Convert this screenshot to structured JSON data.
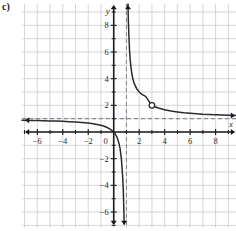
{
  "figure": {
    "part_label": "c)",
    "axis_names": {
      "x": "x",
      "y": "y"
    }
  },
  "chart_data": {
    "type": "line",
    "title": "",
    "xlabel": "x",
    "ylabel": "y",
    "grid": true,
    "legend": "none",
    "xlim": [
      -7.2,
      9.6
    ],
    "ylim": [
      -7.2,
      9.6
    ],
    "xticks": [
      -6,
      -4,
      -2,
      0,
      2,
      4,
      6,
      8
    ],
    "yticks": [
      -6,
      -4,
      -2,
      2,
      4,
      6,
      8
    ],
    "xtick_labels": [
      "−6",
      "−4",
      "−2",
      "0",
      "2",
      "4",
      "6",
      "8"
    ],
    "ytick_labels": [
      "−6",
      "−4",
      "−2",
      "2",
      "4",
      "6",
      "8"
    ],
    "origin_label": "0",
    "tick_step": 1,
    "asymptotes": [
      {
        "kind": "vertical",
        "value": 1,
        "style": "dashed",
        "label": "x = 1"
      },
      {
        "kind": "horizontal",
        "value": 1,
        "style": "dashed",
        "label": "y = 1"
      }
    ],
    "holes": [
      {
        "x": 3,
        "y": 2,
        "style": "open-circle"
      }
    ],
    "series": [
      {
        "name": "left-branch",
        "description": "branch left of x = 1, approaches y = 1 from below going left and dives to minus infinity approaching x = 1",
        "arrows": [
          "left",
          "down"
        ],
        "points": [
          [
            -7.2,
            0.878
          ],
          [
            -6.5,
            0.867
          ],
          [
            -6.0,
            0.857
          ],
          [
            -5.5,
            0.846
          ],
          [
            -5.0,
            0.833
          ],
          [
            -4.5,
            0.818
          ],
          [
            -4.0,
            0.8
          ],
          [
            -3.5,
            0.778
          ],
          [
            -3.0,
            0.75
          ],
          [
            -2.5,
            0.714
          ],
          [
            -2.0,
            0.667
          ],
          [
            -1.5,
            0.6
          ],
          [
            -1.0,
            0.5
          ],
          [
            -0.75,
            0.429
          ],
          [
            -0.5,
            0.333
          ],
          [
            -0.25,
            0.2
          ],
          [
            0.0,
            0.0
          ],
          [
            0.1,
            -0.125
          ],
          [
            0.2,
            -0.286
          ],
          [
            0.3,
            -0.5
          ],
          [
            0.4,
            -0.8
          ],
          [
            0.5,
            -1.25
          ],
          [
            0.6,
            -2.0
          ],
          [
            0.7,
            -3.333
          ],
          [
            0.75,
            -4.286
          ],
          [
            0.8,
            -6.0
          ],
          [
            0.82,
            -6.9
          ]
        ]
      },
      {
        "name": "right-branch",
        "description": "branch right of x = 1, rises to plus infinity approaching x = 1 and approaches y = 1 from above going right, with a hole at (3, 2)",
        "arrows": [
          "up",
          "right"
        ],
        "points": [
          [
            1.12,
            9.6
          ],
          [
            1.15,
            8.33
          ],
          [
            1.2,
            7.0
          ],
          [
            1.25,
            6.0
          ],
          [
            1.3,
            5.33
          ],
          [
            1.4,
            4.5
          ],
          [
            1.5,
            4.0
          ],
          [
            1.6,
            3.67
          ],
          [
            1.8,
            3.25
          ],
          [
            2.0,
            3.0
          ],
          [
            2.25,
            2.8
          ],
          [
            2.5,
            2.67
          ],
          [
            3.0,
            2.0
          ],
          [
            3.5,
            1.8
          ],
          [
            4.0,
            1.67
          ],
          [
            4.5,
            1.57
          ],
          [
            5.0,
            1.5
          ],
          [
            5.5,
            1.44
          ],
          [
            6.0,
            1.4
          ],
          [
            7.0,
            1.33
          ],
          [
            8.0,
            1.29
          ],
          [
            9.0,
            1.25
          ],
          [
            9.6,
            1.23
          ]
        ]
      }
    ],
    "colors": {
      "curve": "#2a2a2a",
      "axis": "#1a1a1a",
      "grid": "#c9c9d2",
      "asymptote": "#8a8a96",
      "hole_fill": "#ffffff",
      "background": "#ffffff"
    }
  }
}
